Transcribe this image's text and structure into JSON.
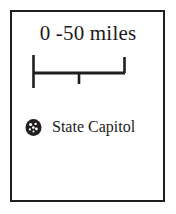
{
  "legend": {
    "scale": {
      "title": "0 -50 miles",
      "units": "miles",
      "min_value": "0",
      "max_value": "50",
      "midpoint_value": "25",
      "tick_count": 3
    },
    "symbols": [
      {
        "icon": "state-capitol-dot-icon",
        "label": "State Capitol"
      }
    ],
    "colors": {
      "ink": "#211f1e",
      "text": "#1c1a19",
      "background": "#ffffff",
      "symbol_fill": "#231f20"
    }
  }
}
